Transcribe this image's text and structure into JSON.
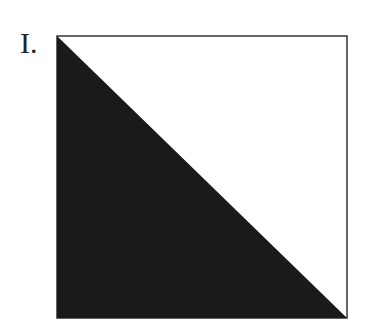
{
  "figure": {
    "label": "I.",
    "shape": "square divided by diagonal from top-left to bottom-right",
    "shaded_region": "lower-left triangle",
    "fill_color": "#1a1a1a",
    "stroke_color": "#333333",
    "background_color": "#ffffff"
  }
}
